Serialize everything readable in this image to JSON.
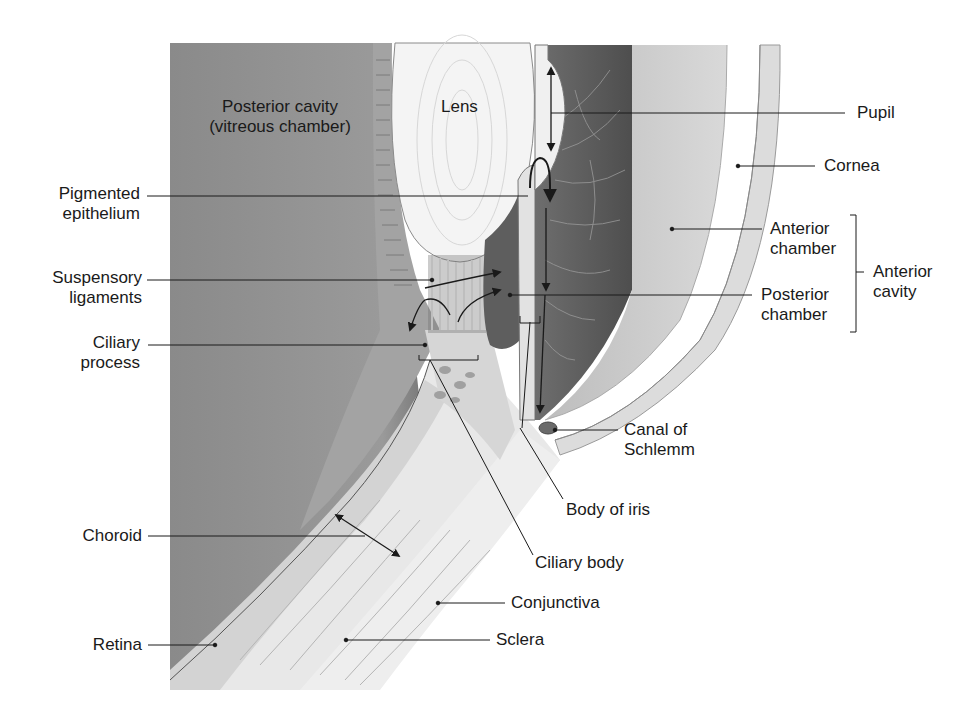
{
  "diagram": {
    "colors": {
      "background": "#ffffff",
      "vitreous": "#8f8f8f",
      "lens": "#f2f2f2",
      "iris": "#5e5e5e",
      "aqueous": "#cfcfcf",
      "cornea": "#dcdcdc",
      "sclera": "#e6e6e6",
      "choroid": "#c2c2c2",
      "lines": "#1a1a1a"
    },
    "region_labels": {
      "posterior_cavity": [
        "Posterior cavity",
        "(vitreous chamber)"
      ],
      "lens": "Lens"
    },
    "left_labels": {
      "pigmented_epithelium": [
        "Pigmented",
        "epithelium"
      ],
      "suspensory_ligaments": [
        "Suspensory",
        "ligaments"
      ],
      "ciliary_process": [
        "Ciliary",
        "process"
      ],
      "choroid": "Choroid",
      "retina": "Retina"
    },
    "right_labels": {
      "pupil": "Pupil",
      "cornea": "Cornea",
      "anterior_chamber": [
        "Anterior",
        "chamber"
      ],
      "posterior_chamber": [
        "Posterior",
        "chamber"
      ],
      "anterior_cavity": [
        "Anterior",
        "cavity"
      ],
      "canal_of_schlemm": [
        "Canal of",
        "Schlemm"
      ],
      "body_of_iris": "Body of iris",
      "ciliary_body": "Ciliary body",
      "conjunctiva": "Conjunctiva",
      "sclera": "Sclera"
    }
  }
}
